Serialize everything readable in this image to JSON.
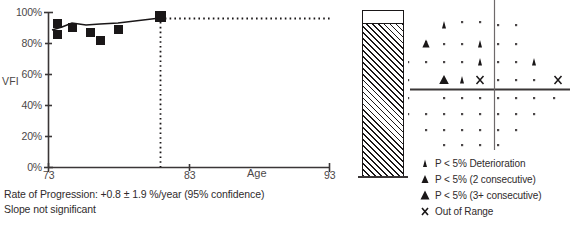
{
  "chart_data": {
    "type": "scatter",
    "title": "",
    "xlabel": "Age",
    "ylabel": "VFI",
    "xlim": [
      73,
      93
    ],
    "ylim": [
      0,
      100
    ],
    "xticks": [
      73,
      83,
      93
    ],
    "xtick_labels": [
      "73",
      "83",
      "93"
    ],
    "yticks": [
      0,
      20,
      40,
      60,
      80,
      100
    ],
    "ytick_labels": [
      "0%",
      "20%",
      "40%",
      "60%",
      "80%",
      "100%"
    ],
    "grid": false,
    "legend_position": "bottom-right",
    "series": [
      {
        "name": "VFI measurements",
        "marker": "filled-square",
        "x": [
          73.5,
          73.5,
          74.6,
          75.9,
          76.5,
          77.7,
          80.2
        ],
        "values": [
          93,
          87,
          92,
          89,
          84,
          90,
          98
        ]
      },
      {
        "name": "Regression trend",
        "marker": "line",
        "x": [
          73.4,
          74.6,
          75.9,
          77.7,
          80.2
        ],
        "values": [
          88,
          91,
          90,
          91,
          93
        ]
      },
      {
        "name": "Projection",
        "marker": "dotted-line",
        "x": [
          80.2,
          93.0
        ],
        "values": [
          93,
          93
        ]
      }
    ]
  },
  "vfi_chart": {
    "y_axis_title": "VFI",
    "x_axis_title": "Age",
    "y_tick_labels": [
      "100%",
      "80%",
      "60%",
      "40%",
      "20%",
      "0%"
    ],
    "x_tick_labels": [
      "73",
      "83",
      "93"
    ]
  },
  "footer": {
    "rate_of_progression": "Rate of Progression: +0.8 ± 1.9 %/year (95% confidence)",
    "significance": "Slope not significant"
  },
  "vfi_bar": {
    "label": "VFI bar indicator",
    "fill_percent": 93
  },
  "probability_plot": {
    "description": "Glaucoma Progression Analysis probability plot",
    "symbols": [
      {
        "type": "dot",
        "x": 54,
        "y": 22
      },
      {
        "type": "dot",
        "x": 72,
        "y": 22
      },
      {
        "type": "small-triangle",
        "x": 36,
        "y": 25
      },
      {
        "type": "dot",
        "x": 90,
        "y": 25
      },
      {
        "type": "dot",
        "x": 108,
        "y": 25
      },
      {
        "type": "dot",
        "x": 18,
        "y": 42
      },
      {
        "type": "small-triangle",
        "x": 72,
        "y": 44
      },
      {
        "type": "dot",
        "x": 54,
        "y": 44
      },
      {
        "type": "dot",
        "x": 90,
        "y": 44
      },
      {
        "type": "dot",
        "x": 108,
        "y": 44
      },
      {
        "type": "medium-triangle",
        "x": 18,
        "y": 44
      },
      {
        "type": "dot",
        "x": 36,
        "y": 44
      },
      {
        "type": "dot",
        "x": 0,
        "y": 62
      },
      {
        "type": "dot",
        "x": 18,
        "y": 62
      },
      {
        "type": "dot",
        "x": 36,
        "y": 62
      },
      {
        "type": "dot",
        "x": 54,
        "y": 62
      },
      {
        "type": "small-triangle",
        "x": 72,
        "y": 62
      },
      {
        "type": "dot",
        "x": 90,
        "y": 62
      },
      {
        "type": "dot",
        "x": 108,
        "y": 62
      },
      {
        "type": "small-triangle",
        "x": 126,
        "y": 62
      },
      {
        "type": "dot",
        "x": 0,
        "y": 80
      },
      {
        "type": "large-triangle",
        "x": 36,
        "y": 80
      },
      {
        "type": "small-triangle",
        "x": 54,
        "y": 80
      },
      {
        "type": "x-mark",
        "x": 72,
        "y": 80
      },
      {
        "type": "dot",
        "x": 90,
        "y": 80
      },
      {
        "type": "dot",
        "x": 108,
        "y": 80
      },
      {
        "type": "dot",
        "x": 126,
        "y": 80
      },
      {
        "type": "x-mark",
        "x": 150,
        "y": 80
      },
      {
        "type": "dot",
        "x": 0,
        "y": 98
      },
      {
        "type": "dot",
        "x": 36,
        "y": 98
      },
      {
        "type": "dot",
        "x": 54,
        "y": 98
      },
      {
        "type": "dot",
        "x": 72,
        "y": 98
      },
      {
        "type": "dot",
        "x": 90,
        "y": 98
      },
      {
        "type": "dot",
        "x": 108,
        "y": 98
      },
      {
        "type": "dot",
        "x": 126,
        "y": 98
      },
      {
        "type": "dot",
        "x": 146,
        "y": 98
      },
      {
        "type": "dot",
        "x": 0,
        "y": 114
      },
      {
        "type": "dot",
        "x": 18,
        "y": 114
      },
      {
        "type": "dot",
        "x": 36,
        "y": 114
      },
      {
        "type": "dot",
        "x": 54,
        "y": 114
      },
      {
        "type": "dot",
        "x": 72,
        "y": 114
      },
      {
        "type": "dot",
        "x": 90,
        "y": 114
      },
      {
        "type": "dot",
        "x": 108,
        "y": 114
      },
      {
        "type": "dot",
        "x": 126,
        "y": 114
      },
      {
        "type": "dot",
        "x": 18,
        "y": 130
      },
      {
        "type": "dot",
        "x": 36,
        "y": 130
      },
      {
        "type": "dot",
        "x": 54,
        "y": 130
      },
      {
        "type": "dot",
        "x": 72,
        "y": 130
      },
      {
        "type": "dot",
        "x": 90,
        "y": 130
      },
      {
        "type": "dot",
        "x": 108,
        "y": 130
      },
      {
        "type": "dot",
        "x": 36,
        "y": 145
      },
      {
        "type": "dot",
        "x": 54,
        "y": 145
      },
      {
        "type": "dot",
        "x": 72,
        "y": 145
      },
      {
        "type": "dot",
        "x": 90,
        "y": 145
      }
    ]
  },
  "legend": {
    "items": [
      {
        "symbol": "small-triangle",
        "label": "P < 5% Deterioration"
      },
      {
        "symbol": "medium-triangle",
        "label": "P < 5% (2 consecutive)"
      },
      {
        "symbol": "large-triangle",
        "label": "P < 5% (3+ consecutive)"
      },
      {
        "symbol": "x-mark",
        "label": "Out of Range"
      }
    ]
  },
  "colors": {
    "ink": "#1a1718",
    "axis": "#3a3637",
    "text": "#2f2b2c",
    "muted": "#4b4748"
  }
}
